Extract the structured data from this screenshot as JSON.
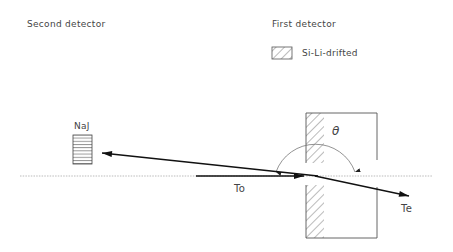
{
  "labels": {
    "second_detector": "Second detector",
    "first_detector": "First detector",
    "legend_si_li": "Si-Li-drifted",
    "naj": "NaJ",
    "theta": "θ",
    "incoming": "To",
    "outgoing": "Te"
  },
  "legend": {
    "items": [
      {
        "pattern": "diagonal-hatch",
        "label": "Si-Li-drifted"
      }
    ]
  }
}
